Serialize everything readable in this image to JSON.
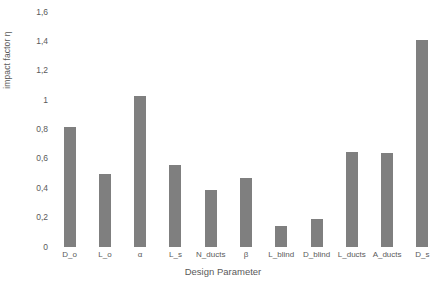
{
  "chart_data": {
    "type": "bar",
    "title": "",
    "xlabel": "Design Parameter",
    "ylabel": "impact factor η",
    "categories": [
      "D_o",
      "L_o",
      "α",
      "L_s",
      "N_ducts",
      "β",
      "L_blind",
      "D_blind",
      "L_ducts",
      "A_ducts",
      "D_s"
    ],
    "values": [
      0.82,
      0.5,
      1.03,
      0.56,
      0.39,
      0.47,
      0.14,
      0.19,
      0.65,
      0.64,
      1.41
    ],
    "ylim": [
      0,
      1.6
    ],
    "ytick_labels": [
      "1,6",
      "1,4",
      "1,2",
      "1",
      "0,8",
      "0,6",
      "0,4",
      "0,2",
      "0"
    ],
    "ytick_values": [
      1.6,
      1.4,
      1.2,
      1.0,
      0.8,
      0.6,
      0.4,
      0.2,
      0
    ],
    "grid": false,
    "legend": false,
    "bar_color": "#7f7f7f",
    "text_color": "#5a5a5a",
    "background": "#ffffff"
  }
}
